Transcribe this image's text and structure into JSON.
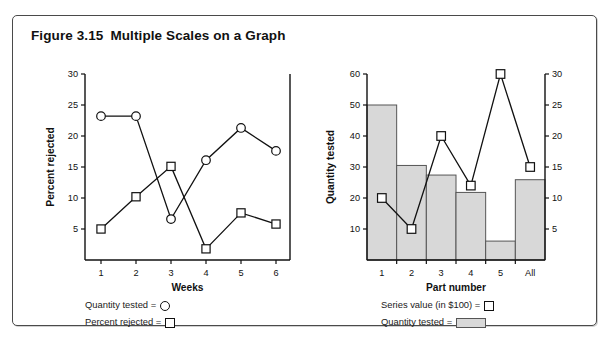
{
  "figure": {
    "number": "Figure 3.15",
    "title": "Multiple Scales on a Graph"
  },
  "colors": {
    "bar_fill": "#d8d8d8",
    "bar_stroke": "#555555",
    "line": "#111111",
    "frame": "#4a4a4a",
    "text": "#111111"
  },
  "chart_data": [
    {
      "id": "left",
      "type": "line",
      "title": "",
      "xlabel": "Weeks",
      "ylabel": "Percent rejected",
      "y2label": "",
      "categories": [
        "1",
        "2",
        "3",
        "4",
        "5",
        "6"
      ],
      "ylim": [
        0,
        30
      ],
      "yticks": [
        5,
        10,
        15,
        20,
        25,
        30
      ],
      "grid": false,
      "legend_position": "below",
      "series": [
        {
          "name": "Quantity tested",
          "marker": "circle",
          "values": [
            23.2,
            23.2,
            6.6,
            16.1,
            21.3,
            17.6
          ]
        },
        {
          "name": "Percent rejected",
          "marker": "square",
          "values": [
            5.0,
            10.2,
            15.1,
            1.8,
            7.6,
            5.8
          ]
        }
      ]
    },
    {
      "id": "right",
      "type": "bar",
      "title": "",
      "xlabel": "Part number",
      "ylabel": "Quantity tested",
      "y2label": "",
      "categories": [
        "1",
        "2",
        "3",
        "4",
        "5",
        "All"
      ],
      "ylim": [
        0,
        60
      ],
      "yticks": [
        10,
        20,
        30,
        40,
        50,
        60
      ],
      "y2lim": [
        0,
        30
      ],
      "y2ticks": [
        5,
        10,
        15,
        20,
        25,
        30
      ],
      "grid": false,
      "legend_position": "below",
      "series": [
        {
          "name": "Quantity tested",
          "marker": "bar",
          "axis": "left",
          "values": [
            50,
            30.5,
            27.4,
            21.8,
            6.1,
            25.9
          ]
        },
        {
          "name": "Series value (in $100)",
          "marker": "square",
          "axis": "right",
          "values": [
            10,
            5,
            20,
            12,
            30,
            15
          ]
        }
      ]
    }
  ],
  "legends": {
    "left": [
      {
        "label": "Quantity tested =",
        "swatch": "circle-marker"
      },
      {
        "label": "Percent rejected =",
        "swatch": "square-marker"
      }
    ],
    "right": [
      {
        "label": "Series value (in $100) =",
        "swatch": "square-marker"
      },
      {
        "label": "Quantity tested =",
        "swatch": "bar-swatch"
      }
    ]
  }
}
